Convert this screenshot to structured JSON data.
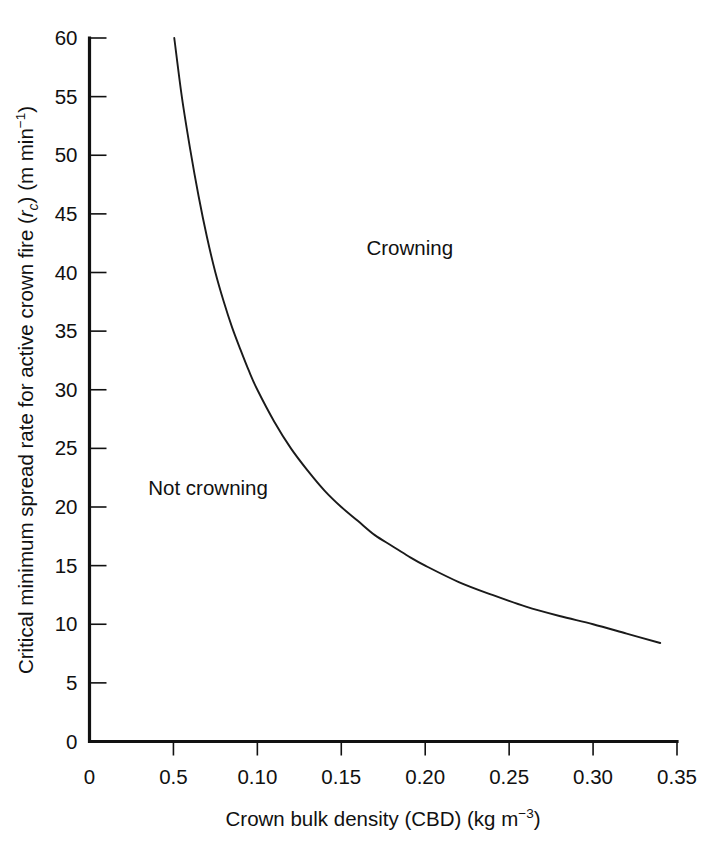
{
  "chart_data": {
    "type": "line",
    "title": "",
    "xlabel": "Crown bulk density (CBD) (kg m⁻³)",
    "ylabel": "Critical minimum spread rate for active crown fire (rᴄ) (m min⁻¹)",
    "xlim": [
      0,
      0.35
    ],
    "ylim": [
      0,
      60
    ],
    "grid": false,
    "legend": "none",
    "x_ticks": [
      0,
      0.05,
      0.1,
      0.15,
      0.2,
      0.25,
      0.3,
      0.35
    ],
    "x_tick_labels": [
      "0",
      "0.5",
      "0.10",
      "0.15",
      "0.20",
      "0.25",
      "0.30",
      "0.35"
    ],
    "y_ticks": [
      0,
      5,
      10,
      15,
      20,
      25,
      30,
      35,
      40,
      45,
      50,
      55,
      60
    ],
    "y_tick_labels": [
      "0",
      "5",
      "10",
      "15",
      "20",
      "25",
      "30",
      "35",
      "40",
      "45",
      "50",
      "55",
      "60"
    ],
    "series": [
      {
        "name": "Critical minimum spread rate threshold",
        "x": [
          0.0505,
          0.055,
          0.06,
          0.065,
          0.07,
          0.075,
          0.08,
          0.085,
          0.09,
          0.095,
          0.1,
          0.11,
          0.12,
          0.13,
          0.14,
          0.15,
          0.16,
          0.17,
          0.18,
          0.19,
          0.2,
          0.22,
          0.24,
          0.26,
          0.28,
          0.3,
          0.32,
          0.34
        ],
        "y": [
          60.0,
          55.0,
          50.5,
          46.5,
          43.0,
          40.0,
          37.5,
          35.3,
          33.4,
          31.6,
          30.0,
          27.3,
          25.0,
          23.1,
          21.4,
          20.0,
          18.8,
          17.6,
          16.7,
          15.8,
          15.0,
          13.6,
          12.5,
          11.5,
          10.7,
          10.0,
          9.2,
          8.4
        ]
      }
    ],
    "annotations": [
      {
        "id": "crowning",
        "text": "Crowning",
        "x": 0.165,
        "y": 41.5
      },
      {
        "id": "not-crowning",
        "text": "Not crowning",
        "x": 0.035,
        "y": 21.0
      }
    ]
  },
  "axis": {
    "x_title_parts": {
      "main": "Crown bulk density (CBD) (kg m",
      "exponent": "−3",
      "tail": ")"
    },
    "y_title_parts": {
      "lead": "Critical minimum spread rate for active crown fire (",
      "symbol": "r",
      "subscript": "c",
      "mid": ") (m min",
      "exponent": "−1",
      "tail": ")"
    }
  },
  "colors": {
    "ink": "#111111",
    "curve": "#1a1a1a",
    "background": "#ffffff"
  }
}
